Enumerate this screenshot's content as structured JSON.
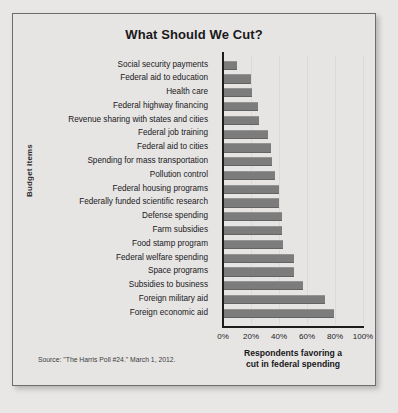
{
  "figure": {
    "title": "What Should We Cut?",
    "source_note": "Source: \"The Harris Poll #24.\" March 1, 2012."
  },
  "chart_data": {
    "type": "bar",
    "orientation": "horizontal",
    "title": "What Should We Cut?",
    "xlabel_line1": "Respondents favoring a",
    "xlabel_line2": "cut in federal spending",
    "ylabel": "Budget items",
    "xlim": [
      0,
      100
    ],
    "grid": true,
    "legend": "none",
    "tick_labels": [
      "0%",
      "20%",
      "40%",
      "60%",
      "80%",
      "100%"
    ],
    "tick_values": [
      0,
      20,
      40,
      60,
      80,
      100
    ],
    "bar_color": "#7c7c7c",
    "categories": [
      "Social security payments",
      "Federal aid to education",
      "Health care",
      "Federal highway financing",
      "Revenue sharing with states and cities",
      "Federal job training",
      "Federal aid to cities",
      "Spending for mass transportation",
      "Pollution control",
      "Federal housing programs",
      "Federally funded scientific research",
      "Defense spending",
      "Farm subsidies",
      "Food stamp program",
      "Federal welfare spending",
      "Space programs",
      "Subsidies to business",
      "Foreign military aid",
      "Foreign economic aid"
    ],
    "values": [
      10,
      20,
      21,
      25,
      26,
      32,
      34,
      35,
      37,
      40,
      40,
      42,
      42,
      43,
      51,
      51,
      57,
      73,
      79
    ]
  }
}
